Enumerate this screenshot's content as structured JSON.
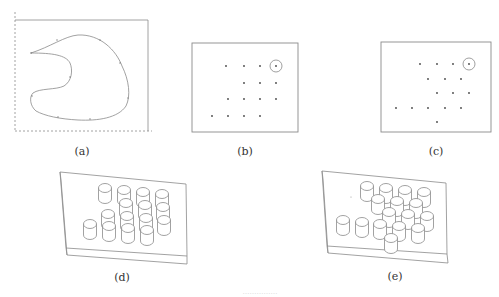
{
  "figure": {
    "subfigures": [
      {
        "id": "a",
        "caption": "(a)",
        "description": "Closed freeform contour inside rectangular boundary (two solid edges, two dashed edges)"
      },
      {
        "id": "b",
        "caption": "(b)",
        "description": "Grid of point positions in rectangle, one point circled"
      },
      {
        "id": "c",
        "caption": "(c)",
        "description": "Staggered arrangement of point positions in rectangle, one point circled"
      },
      {
        "id": "d",
        "caption": "(d)",
        "description": "Isometric plate with cylindrical pins arranged per (b)"
      },
      {
        "id": "e",
        "caption": "(e)",
        "description": "Isometric plate with cylindrical pins arranged per (c)"
      }
    ],
    "bottom_caption": "……………",
    "colors": {
      "line": "#8a8a8a",
      "dot": "#444444",
      "text": "#333333"
    },
    "panel_b_points": [
      [
        226,
        66
      ],
      [
        244,
        66
      ],
      [
        260,
        66
      ],
      [
        276,
        66
      ],
      [
        244,
        83
      ],
      [
        260,
        83
      ],
      [
        276,
        83
      ],
      [
        228,
        99
      ],
      [
        244,
        99
      ],
      [
        260,
        99
      ],
      [
        276,
        99
      ],
      [
        212,
        116
      ],
      [
        228,
        116
      ],
      [
        244,
        116
      ],
      [
        260,
        116
      ]
    ],
    "panel_b_circled": [
      276,
      66
    ],
    "panel_c_points": [
      [
        420,
        64
      ],
      [
        437,
        64
      ],
      [
        453,
        64
      ],
      [
        469,
        64
      ],
      [
        428,
        79
      ],
      [
        445,
        79
      ],
      [
        461,
        79
      ],
      [
        437,
        93
      ],
      [
        453,
        93
      ],
      [
        469,
        93
      ],
      [
        396,
        108
      ],
      [
        412,
        108
      ],
      [
        428,
        108
      ],
      [
        445,
        108
      ],
      [
        461,
        108
      ],
      [
        437,
        122
      ]
    ],
    "panel_c_circled": [
      469,
      64
    ],
    "panel_d_cylinders": [
      [
        105,
        188
      ],
      [
        124,
        190
      ],
      [
        143,
        192
      ],
      [
        162,
        194
      ],
      [
        126,
        203
      ],
      [
        145,
        205
      ],
      [
        163,
        207
      ],
      [
        108,
        214
      ],
      [
        127,
        216
      ],
      [
        146,
        218
      ],
      [
        164,
        220
      ],
      [
        90,
        224
      ],
      [
        109,
        226
      ],
      [
        128,
        228
      ],
      [
        147,
        230
      ]
    ],
    "panel_e_cylinders": [
      [
        367,
        186
      ],
      [
        386,
        188
      ],
      [
        405,
        190
      ],
      [
        424,
        192
      ],
      [
        378,
        199
      ],
      [
        397,
        201
      ],
      [
        416,
        203
      ],
      [
        389,
        212
      ],
      [
        408,
        214
      ],
      [
        427,
        216
      ],
      [
        343,
        220
      ],
      [
        362,
        222
      ],
      [
        380,
        224
      ],
      [
        399,
        226
      ],
      [
        418,
        228
      ],
      [
        391,
        238
      ]
    ]
  }
}
